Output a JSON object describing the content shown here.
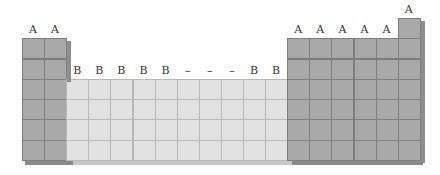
{
  "diagram": {
    "title": "",
    "colors": {
      "A": "#a9a9a9",
      "B": "#e2e2e2",
      "edge": "#7e7e7e",
      "side": "#8e8e8e"
    },
    "geometry": {
      "cell_w": 22.1,
      "row_h": 20.3,
      "bottom": 160
    },
    "columns": [
      {
        "label": "A",
        "type": "A",
        "rows": 6
      },
      {
        "label": "A",
        "type": "A",
        "rows": 6
      },
      {
        "label": "B",
        "type": "B",
        "rows": 4
      },
      {
        "label": "B",
        "type": "B",
        "rows": 4
      },
      {
        "label": "B",
        "type": "B",
        "rows": 4
      },
      {
        "label": "B",
        "type": "B",
        "rows": 4
      },
      {
        "label": "B",
        "type": "B",
        "rows": 4
      },
      {
        "label": "–",
        "type": "B",
        "rows": 4
      },
      {
        "label": "–",
        "type": "B",
        "rows": 4
      },
      {
        "label": "–",
        "type": "B",
        "rows": 4
      },
      {
        "label": "B",
        "type": "B",
        "rows": 4
      },
      {
        "label": "B",
        "type": "B",
        "rows": 4
      },
      {
        "label": "A",
        "type": "A",
        "rows": 6
      },
      {
        "label": "A",
        "type": "A",
        "rows": 6
      },
      {
        "label": "A",
        "type": "A",
        "rows": 6
      },
      {
        "label": "A",
        "type": "A",
        "rows": 6
      },
      {
        "label": "A",
        "type": "A",
        "rows": 6
      },
      {
        "label": "A",
        "type": "A",
        "rows": 7
      }
    ]
  }
}
